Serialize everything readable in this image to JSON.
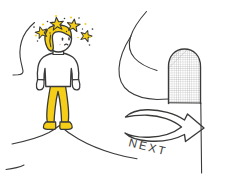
{
  "illustration": {
    "title": "Dazed character beside a path with a NEXT arrow",
    "style": "hand-drawn sketch",
    "background_color": "#ffffff",
    "ink_color": "#3a3a38",
    "accent_color": "#F5CE17",
    "accent_shade_color": "#E8BC0A",
    "skin_color": "#ffffff",
    "shirt_color": "#ffffff",
    "hatch_color": "#8f8f93"
  },
  "labels": {
    "next": "NEXT"
  },
  "elements": {
    "character": {
      "name": "dazed-character",
      "hair_color": "#F5CE17",
      "shirt_color": "#ffffff",
      "pants_color": "#F5CE17",
      "shoes_color": "#F5CE17"
    },
    "stars": {
      "name": "dizzy-stars",
      "count": 4,
      "color": "#F5CE17",
      "sparkle_count": 10
    },
    "arch": {
      "name": "hatched-arch",
      "fill_pattern": "fine-grid",
      "pattern_color": "#9a9aa0"
    },
    "arrow": {
      "name": "next-arrow",
      "direction": "right",
      "outline_color": "#3a3a38"
    },
    "ground_lines": {
      "name": "ground-contour-lines",
      "count": 3
    },
    "path_curve": {
      "name": "background-path-curve",
      "count": 2
    }
  }
}
